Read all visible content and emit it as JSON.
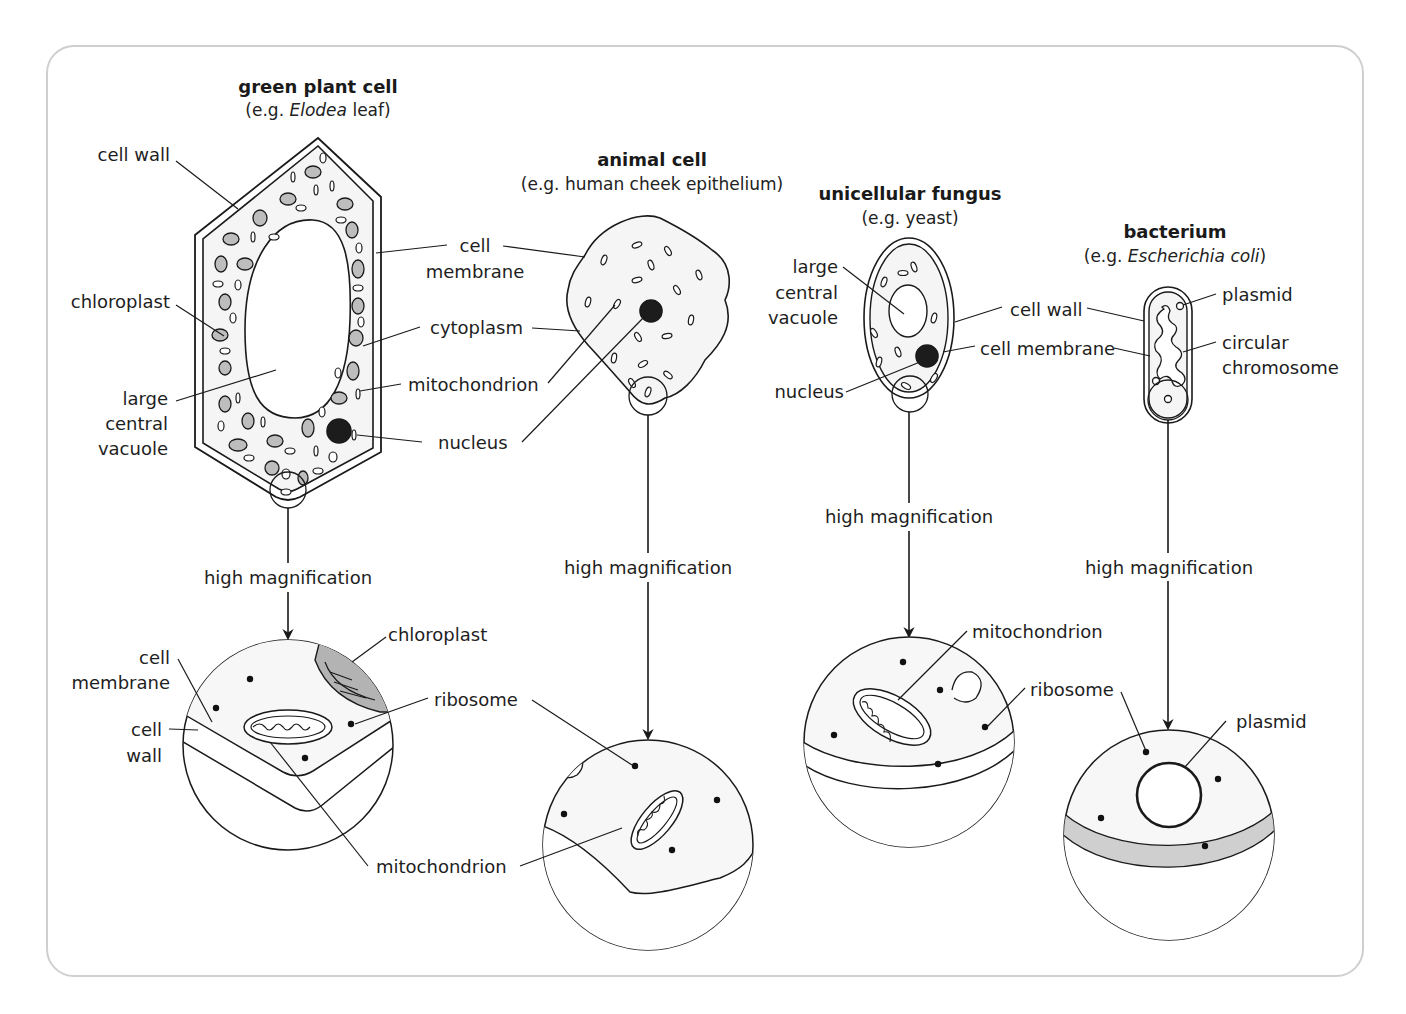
{
  "frame": {
    "border_color": "#cfcfcf",
    "cytoplasm_fill": "#f5f5f5",
    "chloroplast_fill": "#b9b9b9",
    "cell_wall_band": "#cfcfcf"
  },
  "plant": {
    "title": "green plant cell",
    "example_prefix": "(e.g. ",
    "example_italic": "Elodea",
    "example_suffix": " leaf)",
    "labels": {
      "cell_wall": "cell wall",
      "chloroplast": "chloroplast",
      "vacuole_1": "large",
      "vacuole_2": "central",
      "vacuole_3": "vacuole"
    },
    "magnification": "high magnification",
    "zoom_labels": {
      "membrane_1": "cell",
      "membrane_2": "membrane",
      "wall_1": "cell",
      "wall_2": "wall",
      "chloroplast": "chloroplast",
      "ribosome": "ribosome",
      "mitochondrion": "mitochondrion"
    }
  },
  "shared_labels": {
    "membrane_1": "cell",
    "membrane_2": "membrane",
    "cytoplasm": "cytoplasm",
    "mitochondrion": "mitochondrion",
    "nucleus": "nucleus"
  },
  "animal": {
    "title": "animal cell",
    "example": "(e.g. human cheek epithelium)",
    "magnification": "high magnification"
  },
  "fungus": {
    "title": "unicellular fungus",
    "example": "(e.g. yeast)",
    "labels": {
      "vacuole_1": "large",
      "vacuole_2": "central",
      "vacuole_3": "vacuole",
      "nucleus": "nucleus",
      "cell_wall": "cell wall",
      "cell_membrane": "cell membrane"
    },
    "magnification": "high magnification",
    "zoom_labels": {
      "mitochondrion": "mitochondrion",
      "ribosome": "ribosome"
    }
  },
  "bacterium": {
    "title": "bacterium",
    "example_prefix": "(e.g. ",
    "example_italic": "Escherichia coli",
    "example_suffix": ")",
    "labels": {
      "plasmid": "plasmid",
      "chromosome_1": "circular",
      "chromosome_2": "chromosome"
    },
    "magnification": "high magnification",
    "zoom_labels": {
      "plasmid": "plasmid"
    }
  }
}
